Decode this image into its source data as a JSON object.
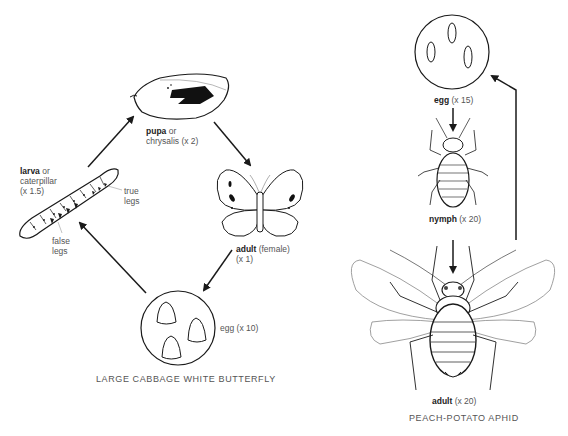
{
  "butterfly": {
    "title": "LARGE CABBAGE WHITE BUTTERFLY",
    "stages": {
      "pupa": {
        "name": "pupa",
        "suffix": " or",
        "line2": "chrysalis (x 2)"
      },
      "adult": {
        "name": "adult",
        "suffix": " (female)",
        "line2": "(x 1)"
      },
      "egg": {
        "name": "egg",
        "suffix": " (x 10)"
      },
      "larva": {
        "name": "larva",
        "suffix": " or",
        "line2": "caterpillar",
        "line3": "(x 1.5)"
      }
    },
    "annotations": {
      "true_legs_1": "true",
      "true_legs_2": "legs",
      "false_legs_1": "false",
      "false_legs_2": "legs"
    },
    "cycle_order": [
      "egg",
      "larva",
      "pupa",
      "adult"
    ]
  },
  "aphid": {
    "title": "PEACH-POTATO APHID",
    "stages": {
      "egg": {
        "name": "egg",
        "suffix": " (x 15)"
      },
      "nymph": {
        "name": "nymph",
        "suffix": " (x 20)"
      },
      "adult": {
        "name": "adult",
        "suffix": " (x 20)"
      }
    },
    "cycle_order": [
      "egg",
      "nymph",
      "adult"
    ]
  },
  "colors": {
    "ink": "#1a1a1a",
    "text": "#555555",
    "background": "#ffffff"
  }
}
